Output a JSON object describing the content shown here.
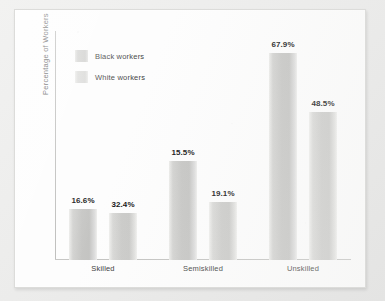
{
  "chart_data": {
    "type": "bar",
    "title": "",
    "xlabel": "",
    "ylabel": "Percentage of Workers",
    "categories": [
      "Skilled",
      "Semiskilled",
      "Unskilled"
    ],
    "series": [
      {
        "name": "Black workers",
        "values": [
          16.6,
          32.4,
          67.9
        ],
        "labels": [
          "16.6%",
          "32.4%",
          "67.9%"
        ],
        "color": "#c6c6c4"
      },
      {
        "name": "White workers",
        "values": [
          15.5,
          19.1,
          48.5
        ],
        "labels": [
          "15.5%",
          "19.1%",
          "48.5%"
        ],
        "color": "#cbcbc9"
      }
    ],
    "ylim": [
      0,
      75
    ],
    "grid": false,
    "legend_position": "top-left",
    "axis_tick_labels": []
  },
  "legend": {
    "items": [
      {
        "label": "Black workers",
        "swatch": "legend-swatch-black-workers"
      },
      {
        "label": "White workers",
        "swatch": "legend-swatch-white-workers"
      }
    ]
  },
  "axis": {
    "y_title": "Percentage of Workers"
  },
  "groups": [
    {
      "category": "Skilled",
      "bars": [
        {
          "series": "Black workers",
          "label": "16.6%",
          "value": 16.6
        },
        {
          "series": "White workers",
          "label": "32.4%",
          "value": 32.4
        }
      ]
    },
    {
      "category": "Semiskilled",
      "bars": [
        {
          "series": "Black workers",
          "label": "15.5%",
          "value": 15.5
        },
        {
          "series": "White workers",
          "label": "19.1%",
          "value": 19.1
        }
      ]
    },
    {
      "category": "Unskilled",
      "bars": [
        {
          "series": "Black workers",
          "label": "67.9%",
          "value": 67.9
        },
        {
          "series": "White workers",
          "label": "48.5%",
          "value": 48.5
        }
      ]
    }
  ]
}
